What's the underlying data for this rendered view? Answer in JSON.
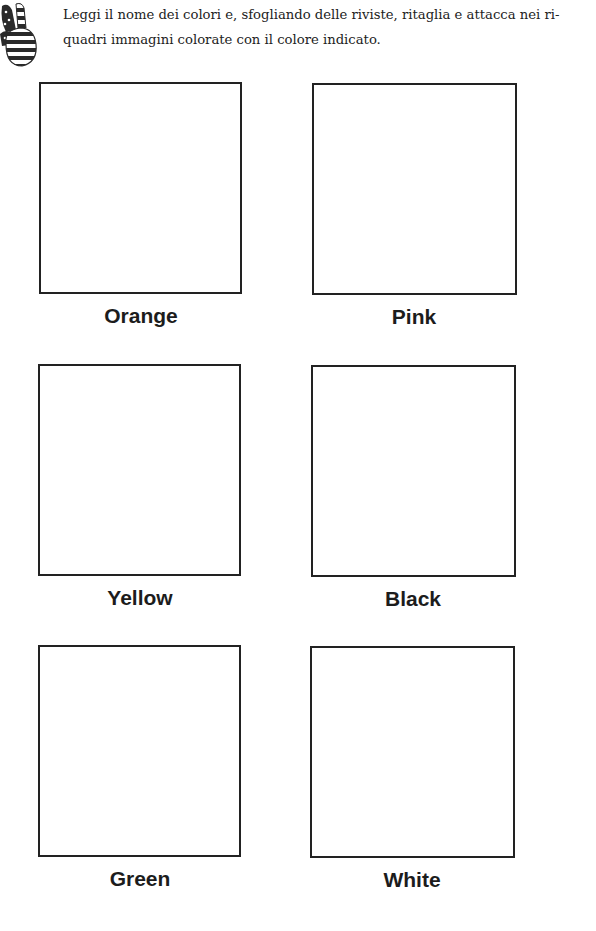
{
  "header": {
    "icon": "striped-hand-icon",
    "instruction_lines": [
      "Leggi il nome dei colori e, sfogliando delle riviste, ritaglia e attacca nei ri-",
      "quadri immagini colorate con il colore indicato."
    ]
  },
  "boxes": [
    {
      "label": "Orange"
    },
    {
      "label": "Pink"
    },
    {
      "label": "Yellow"
    },
    {
      "label": "Black"
    },
    {
      "label": "Green"
    },
    {
      "label": "White"
    }
  ]
}
